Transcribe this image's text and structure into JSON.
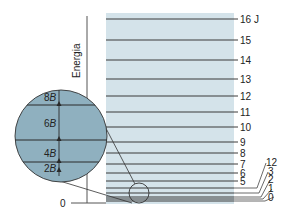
{
  "axis": {
    "label": "Energia",
    "zero_label": "0"
  },
  "levels": [
    {
      "J": "16",
      "y": 19,
      "label": "16 J"
    },
    {
      "J": "15",
      "y": 40,
      "label": "15"
    },
    {
      "J": "14",
      "y": 60,
      "label": "14"
    },
    {
      "J": "13",
      "y": 79,
      "label": "13"
    },
    {
      "J": "12",
      "y": 96,
      "label": "12"
    },
    {
      "J": "11",
      "y": 112,
      "label": "11"
    },
    {
      "J": "10",
      "y": 127,
      "label": "10"
    },
    {
      "J": "9",
      "y": 142,
      "label": "9"
    },
    {
      "J": "8",
      "y": 153,
      "label": "8"
    },
    {
      "J": "7",
      "y": 164,
      "label": "7"
    },
    {
      "J": "6",
      "y": 173,
      "label": "6"
    },
    {
      "J": "5",
      "y": 181,
      "label": "5"
    },
    {
      "J": "4",
      "y": 188,
      "label": "4"
    },
    {
      "J": "3",
      "y": 193,
      "label": "3"
    },
    {
      "J": "2",
      "y": 197,
      "label": "2"
    },
    {
      "J": "1",
      "y": 199,
      "label": "1"
    },
    {
      "J": "0",
      "y": 201,
      "label": "0"
    }
  ],
  "inset": {
    "spacings": [
      {
        "coef": "8",
        "sym": "B"
      },
      {
        "coef": "6",
        "sym": "B"
      },
      {
        "coef": "4",
        "sym": "B"
      },
      {
        "coef": "2",
        "sym": "B"
      }
    ]
  },
  "colors": {
    "panel": "#d4e3ea",
    "inset": "#8fb0bf",
    "line": "#333333"
  }
}
